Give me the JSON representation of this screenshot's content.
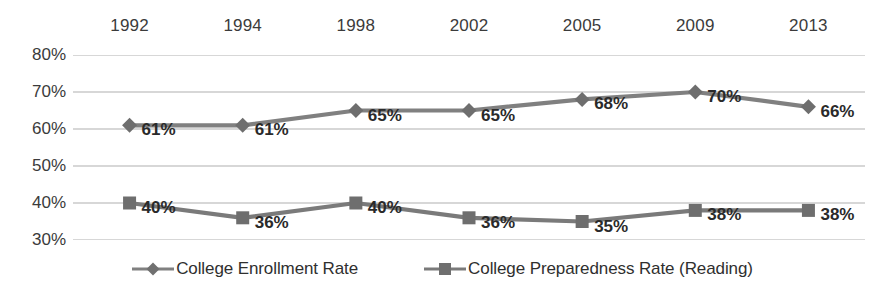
{
  "chart_data": {
    "type": "line",
    "title": "",
    "subtitle": "",
    "xlabel": "",
    "ylabel": "",
    "categories": [
      "1992",
      "1994",
      "1998",
      "2002",
      "2005",
      "2009",
      "2013"
    ],
    "ylim": [
      30,
      80
    ],
    "yticks": [
      "30%",
      "40%",
      "50%",
      "60%",
      "70%",
      "80%"
    ],
    "ytick_values": [
      30,
      40,
      50,
      60,
      70,
      80
    ],
    "grid": true,
    "grid_axis": "y",
    "xaxis_position": "top",
    "legend_position": "bottom",
    "value_suffix": "%",
    "series": [
      {
        "name": "College Enrollment Rate",
        "marker": "diamond",
        "color": "#808080",
        "values": [
          61,
          65,
          65,
          65,
          68,
          70,
          66
        ],
        "plotted_values": [
          61,
          61,
          65,
          65,
          68,
          70,
          66
        ],
        "labels": [
          "61%",
          "61%",
          "65%",
          "65%",
          "68%",
          "70%",
          "66%"
        ]
      },
      {
        "name": "College Preparedness Rate (Reading)",
        "marker": "square",
        "color": "#7a7a7a",
        "values": [
          40,
          36,
          40,
          36,
          35,
          38,
          38
        ],
        "plotted_values": [
          40,
          36,
          40,
          36,
          35,
          38,
          38
        ],
        "labels": [
          "40%",
          "36%",
          "40%",
          "36%",
          "35%",
          "38%",
          "38%"
        ]
      }
    ],
    "colors": {
      "enrollment_line": "#808080",
      "preparedness_line": "#7a7a7a",
      "gridline": "#b0b0b0",
      "axis_text": "#3b3b3b",
      "data_label_text": "#2a2a2a",
      "background": "#ffffff"
    }
  },
  "legend": {
    "items": [
      {
        "label": "College Enrollment Rate",
        "marker": "diamond-marker"
      },
      {
        "label": "College Preparedness Rate (Reading)",
        "marker": "square-marker"
      }
    ]
  }
}
